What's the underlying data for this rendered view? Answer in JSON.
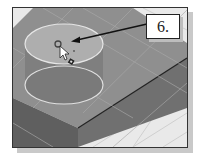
{
  "figure": {
    "callout_label": "6.",
    "callout_target": "circle-sketch-center",
    "cursor": "arrow-pointer",
    "colors": {
      "block_top": "#8f8f8f",
      "block_front": "#6c6c6c",
      "block_side": "#5a5a5a",
      "circle_top_fill": "#aeaeae",
      "circle_outline": "#e0e0e0",
      "grid_line": "#bdbdbd",
      "background": "#e9e9e9",
      "arrow": "#111111"
    }
  }
}
